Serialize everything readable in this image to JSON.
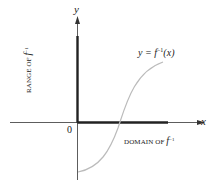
{
  "diagram": {
    "axes": {
      "x_label": "x",
      "y_label": "y",
      "origin_label": "0"
    },
    "curve_label": {
      "prefix": "y = ",
      "func": "f",
      "exp": "−1",
      "arg": "(x)"
    },
    "range_label": {
      "text": "RANGE OF ",
      "func": "f",
      "exp": "−1"
    },
    "domain_label": {
      "text": "DOMAIN OF ",
      "func": "f",
      "exp": "−1"
    },
    "colors": {
      "axis": "#333333",
      "highlight": "#222222",
      "curve": "#bbbbbb"
    }
  }
}
